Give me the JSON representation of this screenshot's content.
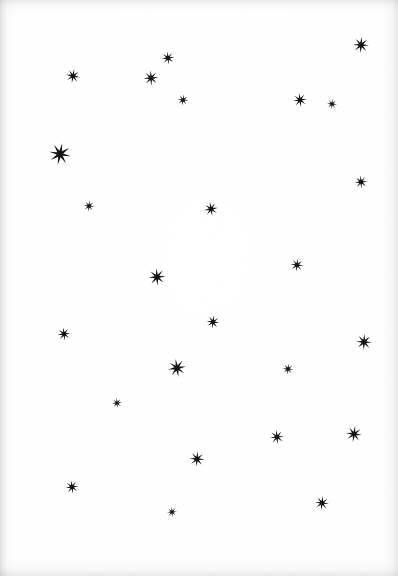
{
  "page": {
    "width": 398,
    "height": 576,
    "background_color": "#fefefe",
    "paper_edge_color": "#a0a0a2"
  },
  "stars": {
    "glyph_name": "eight-pointed-star",
    "ink_color": "#151515",
    "count": 26,
    "items": [
      {
        "id": 1,
        "x": 361,
        "y": 45,
        "size": 16,
        "rotation": 4,
        "label": "star-1"
      },
      {
        "id": 2,
        "x": 168,
        "y": 58,
        "size": 13,
        "rotation": -6,
        "label": "star-2"
      },
      {
        "id": 3,
        "x": 73,
        "y": 76,
        "size": 14,
        "rotation": 10,
        "label": "star-3"
      },
      {
        "id": 4,
        "x": 151,
        "y": 78,
        "size": 15,
        "rotation": -3,
        "label": "star-4"
      },
      {
        "id": 5,
        "x": 183,
        "y": 100,
        "size": 11,
        "rotation": 8,
        "label": "star-5"
      },
      {
        "id": 6,
        "x": 300,
        "y": 100,
        "size": 14,
        "rotation": -8,
        "label": "star-6"
      },
      {
        "id": 7,
        "x": 332,
        "y": 104,
        "size": 10,
        "rotation": 5,
        "label": "star-7"
      },
      {
        "id": 8,
        "x": 60,
        "y": 154,
        "size": 22,
        "rotation": 12,
        "label": "star-8"
      },
      {
        "id": 9,
        "x": 361,
        "y": 182,
        "size": 13,
        "rotation": -5,
        "label": "star-9"
      },
      {
        "id": 10,
        "x": 89,
        "y": 206,
        "size": 11,
        "rotation": 7,
        "label": "star-10"
      },
      {
        "id": 11,
        "x": 211,
        "y": 209,
        "size": 14,
        "rotation": -10,
        "label": "star-11"
      },
      {
        "id": 12,
        "x": 297,
        "y": 265,
        "size": 13,
        "rotation": 6,
        "label": "star-12"
      },
      {
        "id": 13,
        "x": 157,
        "y": 277,
        "size": 17,
        "rotation": -4,
        "label": "star-13"
      },
      {
        "id": 14,
        "x": 213,
        "y": 322,
        "size": 13,
        "rotation": 9,
        "label": "star-14"
      },
      {
        "id": 15,
        "x": 64,
        "y": 334,
        "size": 13,
        "rotation": -7,
        "label": "star-15"
      },
      {
        "id": 16,
        "x": 364,
        "y": 342,
        "size": 16,
        "rotation": 3,
        "label": "star-16"
      },
      {
        "id": 17,
        "x": 177,
        "y": 368,
        "size": 18,
        "rotation": -9,
        "label": "star-17"
      },
      {
        "id": 18,
        "x": 288,
        "y": 369,
        "size": 11,
        "rotation": 6,
        "label": "star-18"
      },
      {
        "id": 19,
        "x": 117,
        "y": 403,
        "size": 10,
        "rotation": -5,
        "label": "star-19"
      },
      {
        "id": 20,
        "x": 354,
        "y": 434,
        "size": 16,
        "rotation": 8,
        "label": "star-20"
      },
      {
        "id": 21,
        "x": 277,
        "y": 437,
        "size": 14,
        "rotation": -6,
        "label": "star-21"
      },
      {
        "id": 22,
        "x": 197,
        "y": 459,
        "size": 15,
        "rotation": 5,
        "label": "star-22"
      },
      {
        "id": 23,
        "x": 72,
        "y": 487,
        "size": 13,
        "rotation": -8,
        "label": "star-23"
      },
      {
        "id": 24,
        "x": 322,
        "y": 503,
        "size": 14,
        "rotation": 7,
        "label": "star-24"
      },
      {
        "id": 25,
        "x": 172,
        "y": 512,
        "size": 10,
        "rotation": -4,
        "label": "star-25"
      },
      {
        "id": 26,
        "x": 211,
        "y": 210,
        "size": 0,
        "rotation": 0,
        "label": "star-spare-hidden"
      }
    ]
  }
}
